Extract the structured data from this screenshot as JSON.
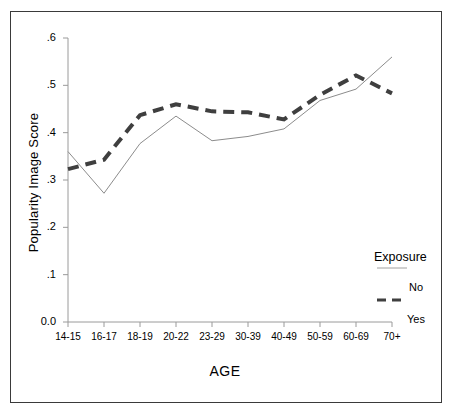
{
  "chart_data": {
    "type": "line",
    "title": "",
    "xlabel": "AGE",
    "ylabel": "Popularity Image Score",
    "categories": [
      "14-15",
      "16-17",
      "18-19",
      "20-22",
      "23-29",
      "30-39",
      "40-49",
      "50-59",
      "60-69",
      "70+"
    ],
    "ylim": [
      0.0,
      0.6
    ],
    "ytick_labels": [
      "0.0",
      ".1",
      ".2",
      ".3",
      ".4",
      ".5",
      ".6"
    ],
    "ytick_values": [
      0.0,
      0.1,
      0.2,
      0.3,
      0.4,
      0.5,
      0.6
    ],
    "grid": false,
    "legend_position": "right",
    "legend_title": "Exposure",
    "series": [
      {
        "name": "No",
        "style": "solid",
        "color": "#8c8c8c",
        "values": [
          0.36,
          0.272,
          0.377,
          0.435,
          0.383,
          0.392,
          0.408,
          0.468,
          0.492,
          0.56
        ]
      },
      {
        "name": "Yes",
        "style": "dashed",
        "color": "#3f3f3f",
        "values": [
          0.323,
          0.343,
          0.437,
          0.46,
          0.445,
          0.443,
          0.428,
          0.48,
          0.521,
          0.483
        ]
      }
    ]
  },
  "axes": {
    "y_axis_name": "y-axis",
    "x_axis_name": "x-axis"
  },
  "legend": {
    "title": "Exposure",
    "entries": [
      {
        "label": "No",
        "style": "solid"
      },
      {
        "label": "Yes",
        "style": "dashed"
      }
    ]
  }
}
